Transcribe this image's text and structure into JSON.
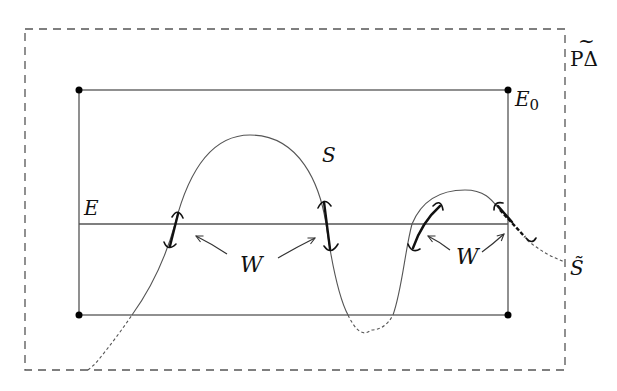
{
  "diagram": {
    "labels": {
      "frame": "PΔ",
      "frame_tilde": "~",
      "top_edge": "E",
      "top_edge_subscript": "0",
      "middle_line": "E",
      "curve": "S",
      "curve_extension": "S̃",
      "wedge_left": "W",
      "wedge_right": "W"
    },
    "colors": {
      "line": "#555555",
      "thick": "#111111",
      "dot": "#000000",
      "dashed": "#555555"
    }
  }
}
